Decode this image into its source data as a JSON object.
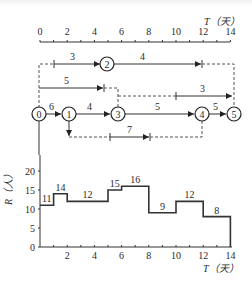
{
  "top_axis": {
    "title": "T（天）",
    "ticks": [
      "0",
      "2",
      "4",
      "6",
      "8",
      "10",
      "12",
      "14"
    ]
  },
  "network": {
    "nodes": [
      {
        "id": "0",
        "label": "0"
      },
      {
        "id": "1",
        "label": "1"
      },
      {
        "id": "2",
        "label": "2"
      },
      {
        "id": "3",
        "label": "3"
      },
      {
        "id": "4",
        "label": "4"
      },
      {
        "id": "5",
        "label": "5"
      }
    ],
    "activities": [
      {
        "from": "0",
        "to": "1",
        "duration": "6"
      },
      {
        "from": "1",
        "to": "3",
        "duration": "4"
      },
      {
        "from": "3",
        "to": "4",
        "duration": "5"
      },
      {
        "from": "4",
        "to": "5",
        "duration": "5"
      },
      {
        "from": "0",
        "to": "2",
        "duration": "3"
      },
      {
        "from": "2",
        "to": "5",
        "duration": "4"
      },
      {
        "from": "0",
        "to": "3",
        "duration": "5"
      },
      {
        "from": "3",
        "to": "5",
        "duration": "3"
      },
      {
        "from": "1",
        "to": "4",
        "duration": "7"
      }
    ]
  },
  "histogram": {
    "ylabel": "R（人）",
    "xlabel": "T（天）",
    "yticks": [
      "0",
      "5",
      "10",
      "15",
      "20"
    ],
    "xticks": [
      "2",
      "4",
      "6",
      "8",
      "10",
      "12",
      "14"
    ]
  },
  "chart_data": {
    "type": "step",
    "xlabel": "T（天）",
    "ylabel": "R（人）",
    "xlim": [
      0,
      14
    ],
    "ylim": [
      0,
      20
    ],
    "segments": [
      {
        "start": 0,
        "end": 1,
        "value": 11
      },
      {
        "start": 1,
        "end": 2,
        "value": 14
      },
      {
        "start": 2,
        "end": 5,
        "value": 12
      },
      {
        "start": 5,
        "end": 6,
        "value": 15
      },
      {
        "start": 6,
        "end": 8,
        "value": 16
      },
      {
        "start": 8,
        "end": 10,
        "value": 9
      },
      {
        "start": 10,
        "end": 12,
        "value": 12
      },
      {
        "start": 12,
        "end": 14,
        "value": 8
      }
    ]
  }
}
